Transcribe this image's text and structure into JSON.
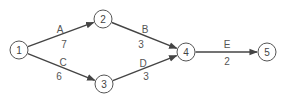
{
  "diagram": {
    "type": "activity-network",
    "nodes": [
      {
        "id": "1",
        "label": "1",
        "x": 19,
        "y": 50
      },
      {
        "id": "2",
        "label": "2",
        "x": 103,
        "y": 19
      },
      {
        "id": "3",
        "label": "3",
        "x": 104,
        "y": 84
      },
      {
        "id": "4",
        "label": "4",
        "x": 186,
        "y": 52
      },
      {
        "id": "5",
        "label": "5",
        "x": 267,
        "y": 52
      }
    ],
    "edges": [
      {
        "from": "1",
        "to": "2",
        "activity": "A",
        "duration": "7",
        "name_pos": [
          60,
          29
        ],
        "dur_pos": [
          64,
          44
        ]
      },
      {
        "from": "2",
        "to": "4",
        "activity": "B",
        "duration": "3",
        "name_pos": [
          145,
          29
        ],
        "dur_pos": [
          141,
          44
        ]
      },
      {
        "from": "1",
        "to": "3",
        "activity": "C",
        "duration": "6",
        "name_pos": [
          63,
          62
        ],
        "dur_pos": [
          59,
          76
        ]
      },
      {
        "from": "3",
        "to": "4",
        "activity": "D",
        "duration": "3",
        "name_pos": [
          143,
          63
        ],
        "dur_pos": [
          146,
          76
        ]
      },
      {
        "from": "4",
        "to": "5",
        "activity": "E",
        "duration": "2",
        "name_pos": [
          227,
          44
        ],
        "dur_pos": [
          227,
          61
        ]
      }
    ],
    "colors": {
      "stroke": "#444444",
      "node_border": "#555555",
      "text": "#444444",
      "background": "#ffffff"
    }
  }
}
